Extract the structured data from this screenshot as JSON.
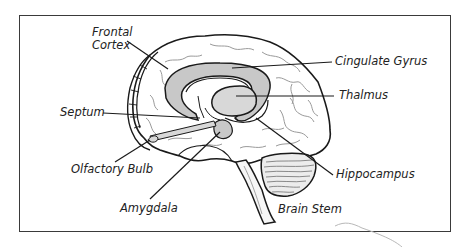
{
  "diagram": {
    "type": "labeled-anatomy-illustration",
    "colors": {
      "outline": "#1a1a1a",
      "sulci": "#9a9a9a",
      "limbic_fill": "#c8c8c8",
      "frame": "#3a3a3a",
      "background": "#ffffff"
    },
    "labels": [
      {
        "id": "frontal-cortex",
        "line1": "Frontal",
        "line2": "Cortex"
      },
      {
        "id": "cingulate-gyrus",
        "text": "Cingulate Gyrus"
      },
      {
        "id": "thalmus",
        "text": "Thalmus"
      },
      {
        "id": "septum",
        "text": "Septum"
      },
      {
        "id": "olfactory-bulb",
        "text": "Olfactory Bulb"
      },
      {
        "id": "hippocampus",
        "text": "Hippocampus"
      },
      {
        "id": "amygdala",
        "text": "Amygdala"
      },
      {
        "id": "brain-stem",
        "text": "Brain Stem"
      }
    ]
  }
}
